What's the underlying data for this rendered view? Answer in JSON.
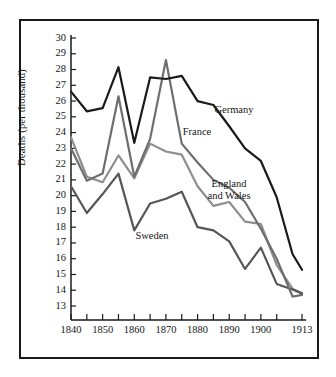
{
  "chart_data": {
    "type": "line",
    "title": "",
    "subtitle": "",
    "xlabel": "",
    "ylabel": "Deaths (per thousand)",
    "xlim": [
      1840,
      1913
    ],
    "ylim": [
      13,
      30
    ],
    "grid": false,
    "legend_position": "inline-annotations",
    "x_tick_labels": [
      "1840",
      "1850",
      "1860",
      "1870",
      "1880",
      "1890",
      "1900",
      "1913"
    ],
    "x_tick_values": [
      1840,
      1850,
      1860,
      1870,
      1880,
      1890,
      1900,
      1913
    ],
    "x_minor_ticks": [
      1845,
      1855,
      1865,
      1875,
      1885,
      1895,
      1905
    ],
    "y_tick_labels": [
      "30",
      "29",
      "28",
      "27",
      "26",
      "25",
      "24",
      "23",
      "22",
      "21",
      "20",
      "19",
      "18",
      "17",
      "16",
      "15",
      "14",
      "13"
    ],
    "y_tick_values": [
      30,
      29,
      28,
      27,
      26,
      25,
      24,
      23,
      22,
      21,
      20,
      19,
      18,
      17,
      16,
      15,
      14,
      13
    ],
    "x": [
      1840,
      1845,
      1850,
      1855,
      1860,
      1865,
      1870,
      1875,
      1880,
      1885,
      1890,
      1895,
      1900,
      1905,
      1910,
      1913
    ],
    "series": [
      {
        "name": "Germany",
        "color": "#1a1a1a",
        "width": 2.2,
        "values": [
          26.6,
          25.35,
          25.55,
          28.15,
          23.35,
          27.5,
          27.4,
          27.6,
          26.0,
          25.75,
          24.4,
          23.0,
          22.2,
          19.9,
          16.3,
          15.3
        ]
      },
      {
        "name": "France",
        "color": "#6e6e6e",
        "width": 2.2,
        "values": [
          23.0,
          20.95,
          21.4,
          26.3,
          21.2,
          23.6,
          28.6,
          23.3,
          22.1,
          21.0,
          20.5,
          19.6,
          17.9,
          16.0,
          13.6,
          13.7
        ]
      },
      {
        "name": "England and Wales",
        "color": "#8e8e8e",
        "width": 2.2,
        "values": [
          23.7,
          21.2,
          20.85,
          22.55,
          21.1,
          23.3,
          22.8,
          22.6,
          20.6,
          19.35,
          19.6,
          18.35,
          18.2,
          15.6,
          14.1,
          13.8
        ]
      },
      {
        "name": "Sweden",
        "color": "#565656",
        "width": 2.2,
        "values": [
          20.6,
          18.9,
          20.1,
          21.4,
          17.8,
          19.5,
          19.8,
          20.25,
          18.0,
          17.8,
          17.1,
          15.35,
          16.7,
          14.4,
          14.05,
          13.8
        ]
      }
    ],
    "annotations": [
      {
        "text": "Germany",
        "series": "Germany",
        "x_px": 234,
        "y_px": 110
      },
      {
        "text": "France",
        "series": "France",
        "x_px": 197,
        "y_px": 132
      },
      {
        "text": "England\nand Wales",
        "line1": "England",
        "line2": "and Wales",
        "series": "England and Wales",
        "x_px": 229,
        "y_px": 184
      },
      {
        "text": "Sweden",
        "series": "Sweden",
        "x_px": 152,
        "y_px": 236
      }
    ]
  }
}
